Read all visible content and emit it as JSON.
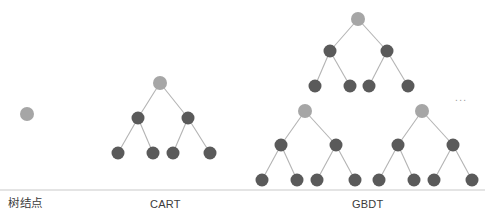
{
  "figure": {
    "width": 485,
    "height": 222,
    "background": "#ffffff",
    "type": "tree-diagram",
    "ellipsis": "..."
  },
  "colors": {
    "node_light": "#a6a6a6",
    "node_dark": "#5a5a5a",
    "edge": "#b3b3b3",
    "divider": "#c9c9c9",
    "text": "#3b3b3b"
  },
  "captions": {
    "tree_node": "树结点",
    "cart": "CART",
    "gbdt": "GBDT"
  },
  "legend_node": {
    "label": "树结点",
    "cx": 27,
    "cy": 114,
    "r": 7,
    "fill": "node_light"
  },
  "trees": [
    {
      "name": "cart",
      "label": "CART",
      "nodes": [
        {
          "id": "c0",
          "cx": 160,
          "cy": 83,
          "r": 7,
          "fill": "node_light",
          "level": 0
        },
        {
          "id": "c1",
          "cx": 138,
          "cy": 118,
          "r": 6.5,
          "fill": "node_dark",
          "level": 1
        },
        {
          "id": "c2",
          "cx": 188,
          "cy": 118,
          "r": 6.5,
          "fill": "node_dark",
          "level": 1
        },
        {
          "id": "c3",
          "cx": 118,
          "cy": 153,
          "r": 6.5,
          "fill": "node_dark",
          "level": 2
        },
        {
          "id": "c4",
          "cx": 153,
          "cy": 153,
          "r": 6.5,
          "fill": "node_dark",
          "level": 2
        },
        {
          "id": "c5",
          "cx": 173,
          "cy": 153,
          "r": 6.5,
          "fill": "node_dark",
          "level": 2
        },
        {
          "id": "c6",
          "cx": 210,
          "cy": 153,
          "r": 6.5,
          "fill": "node_dark",
          "level": 2
        }
      ],
      "edges": [
        [
          "c0",
          "c1"
        ],
        [
          "c0",
          "c2"
        ],
        [
          "c1",
          "c3"
        ],
        [
          "c1",
          "c4"
        ],
        [
          "c2",
          "c5"
        ],
        [
          "c2",
          "c6"
        ]
      ]
    },
    {
      "name": "gbdt-tree-1",
      "label": "",
      "nodes": [
        {
          "id": "g10",
          "cx": 358,
          "cy": 19,
          "r": 7,
          "fill": "node_light",
          "level": 0
        },
        {
          "id": "g11",
          "cx": 330,
          "cy": 51,
          "r": 6.5,
          "fill": "node_dark",
          "level": 1
        },
        {
          "id": "g12",
          "cx": 387,
          "cy": 51,
          "r": 6.5,
          "fill": "node_dark",
          "level": 1
        },
        {
          "id": "g13",
          "cx": 315,
          "cy": 86,
          "r": 6.5,
          "fill": "node_dark",
          "level": 2
        },
        {
          "id": "g14",
          "cx": 350,
          "cy": 86,
          "r": 6.5,
          "fill": "node_dark",
          "level": 2
        },
        {
          "id": "g15",
          "cx": 369,
          "cy": 86,
          "r": 6.5,
          "fill": "node_dark",
          "level": 2
        },
        {
          "id": "g16",
          "cx": 408,
          "cy": 86,
          "r": 6.5,
          "fill": "node_dark",
          "level": 2
        }
      ],
      "edges": [
        [
          "g10",
          "g11"
        ],
        [
          "g10",
          "g12"
        ],
        [
          "g11",
          "g13"
        ],
        [
          "g11",
          "g14"
        ],
        [
          "g12",
          "g15"
        ],
        [
          "g12",
          "g16"
        ]
      ]
    },
    {
      "name": "gbdt-tree-2",
      "label": "",
      "nodes": [
        {
          "id": "g20",
          "cx": 305,
          "cy": 111,
          "r": 7,
          "fill": "node_light",
          "level": 0
        },
        {
          "id": "g21",
          "cx": 281,
          "cy": 145,
          "r": 6.5,
          "fill": "node_dark",
          "level": 1
        },
        {
          "id": "g22",
          "cx": 336,
          "cy": 145,
          "r": 6.5,
          "fill": "node_dark",
          "level": 1
        },
        {
          "id": "g23",
          "cx": 262,
          "cy": 180,
          "r": 6.5,
          "fill": "node_dark",
          "level": 2
        },
        {
          "id": "g24",
          "cx": 297,
          "cy": 180,
          "r": 6.5,
          "fill": "node_dark",
          "level": 2
        },
        {
          "id": "g25",
          "cx": 317,
          "cy": 180,
          "r": 6.5,
          "fill": "node_dark",
          "level": 2
        },
        {
          "id": "g26",
          "cx": 355,
          "cy": 180,
          "r": 6.5,
          "fill": "node_dark",
          "level": 2
        }
      ],
      "edges": [
        [
          "g20",
          "g21"
        ],
        [
          "g20",
          "g22"
        ],
        [
          "g21",
          "g23"
        ],
        [
          "g21",
          "g24"
        ],
        [
          "g22",
          "g25"
        ],
        [
          "g22",
          "g26"
        ]
      ]
    },
    {
      "name": "gbdt-tree-3",
      "label": "",
      "nodes": [
        {
          "id": "g30",
          "cx": 422,
          "cy": 111,
          "r": 7,
          "fill": "node_light",
          "level": 0
        },
        {
          "id": "g31",
          "cx": 398,
          "cy": 145,
          "r": 6.5,
          "fill": "node_dark",
          "level": 1
        },
        {
          "id": "g32",
          "cx": 453,
          "cy": 145,
          "r": 6.5,
          "fill": "node_dark",
          "level": 1
        },
        {
          "id": "g33",
          "cx": 379,
          "cy": 180,
          "r": 6.5,
          "fill": "node_dark",
          "level": 2
        },
        {
          "id": "g34",
          "cx": 414,
          "cy": 180,
          "r": 6.5,
          "fill": "node_dark",
          "level": 2
        },
        {
          "id": "g35",
          "cx": 434,
          "cy": 180,
          "r": 6.5,
          "fill": "node_dark",
          "level": 2
        },
        {
          "id": "g36",
          "cx": 472,
          "cy": 180,
          "r": 6.5,
          "fill": "node_dark",
          "level": 2
        }
      ],
      "edges": [
        [
          "g30",
          "g31"
        ],
        [
          "g30",
          "g32"
        ],
        [
          "g31",
          "g33"
        ],
        [
          "g31",
          "g34"
        ],
        [
          "g32",
          "g35"
        ],
        [
          "g32",
          "g36"
        ]
      ]
    }
  ],
  "divider": {
    "x1": 0,
    "y1": 190,
    "x2": 485,
    "y2": 190
  }
}
